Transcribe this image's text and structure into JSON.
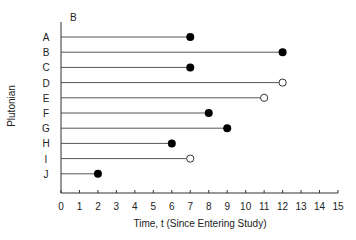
{
  "chart_data": {
    "type": "line",
    "subtype": "swimmer / follow-up time plot",
    "panel_label": "B",
    "title": "",
    "xlabel": "Time, t (Since Entering Study)",
    "ylabel": "Plutonian",
    "xlim": [
      0,
      15
    ],
    "x_ticks": [
      0,
      1,
      2,
      3,
      4,
      5,
      6,
      7,
      8,
      9,
      10,
      11,
      12,
      13,
      14,
      15
    ],
    "grid": false,
    "legend": null,
    "categories": [
      "A",
      "B",
      "C",
      "D",
      "E",
      "F",
      "G",
      "H",
      "I",
      "J"
    ],
    "series": [
      {
        "name": "A",
        "start": 0,
        "end": 7,
        "event": "filled"
      },
      {
        "name": "B",
        "start": 0,
        "end": 12,
        "event": "filled"
      },
      {
        "name": "C",
        "start": 0,
        "end": 7,
        "event": "filled"
      },
      {
        "name": "D",
        "start": 0,
        "end": 12,
        "event": "open"
      },
      {
        "name": "E",
        "start": 0,
        "end": 11,
        "event": "open"
      },
      {
        "name": "F",
        "start": 0,
        "end": 8,
        "event": "filled"
      },
      {
        "name": "G",
        "start": 0,
        "end": 9,
        "event": "filled"
      },
      {
        "name": "H",
        "start": 0,
        "end": 6,
        "event": "filled"
      },
      {
        "name": "I",
        "start": 0,
        "end": 7,
        "event": "open"
      },
      {
        "name": "J",
        "start": 0,
        "end": 2,
        "event": "filled"
      }
    ],
    "marker_legend_note": "filled circle = event; open circle = censored"
  },
  "colors": {
    "line": "#555555",
    "axis": "#333333",
    "marker": "#000000",
    "background": "#ffffff"
  }
}
